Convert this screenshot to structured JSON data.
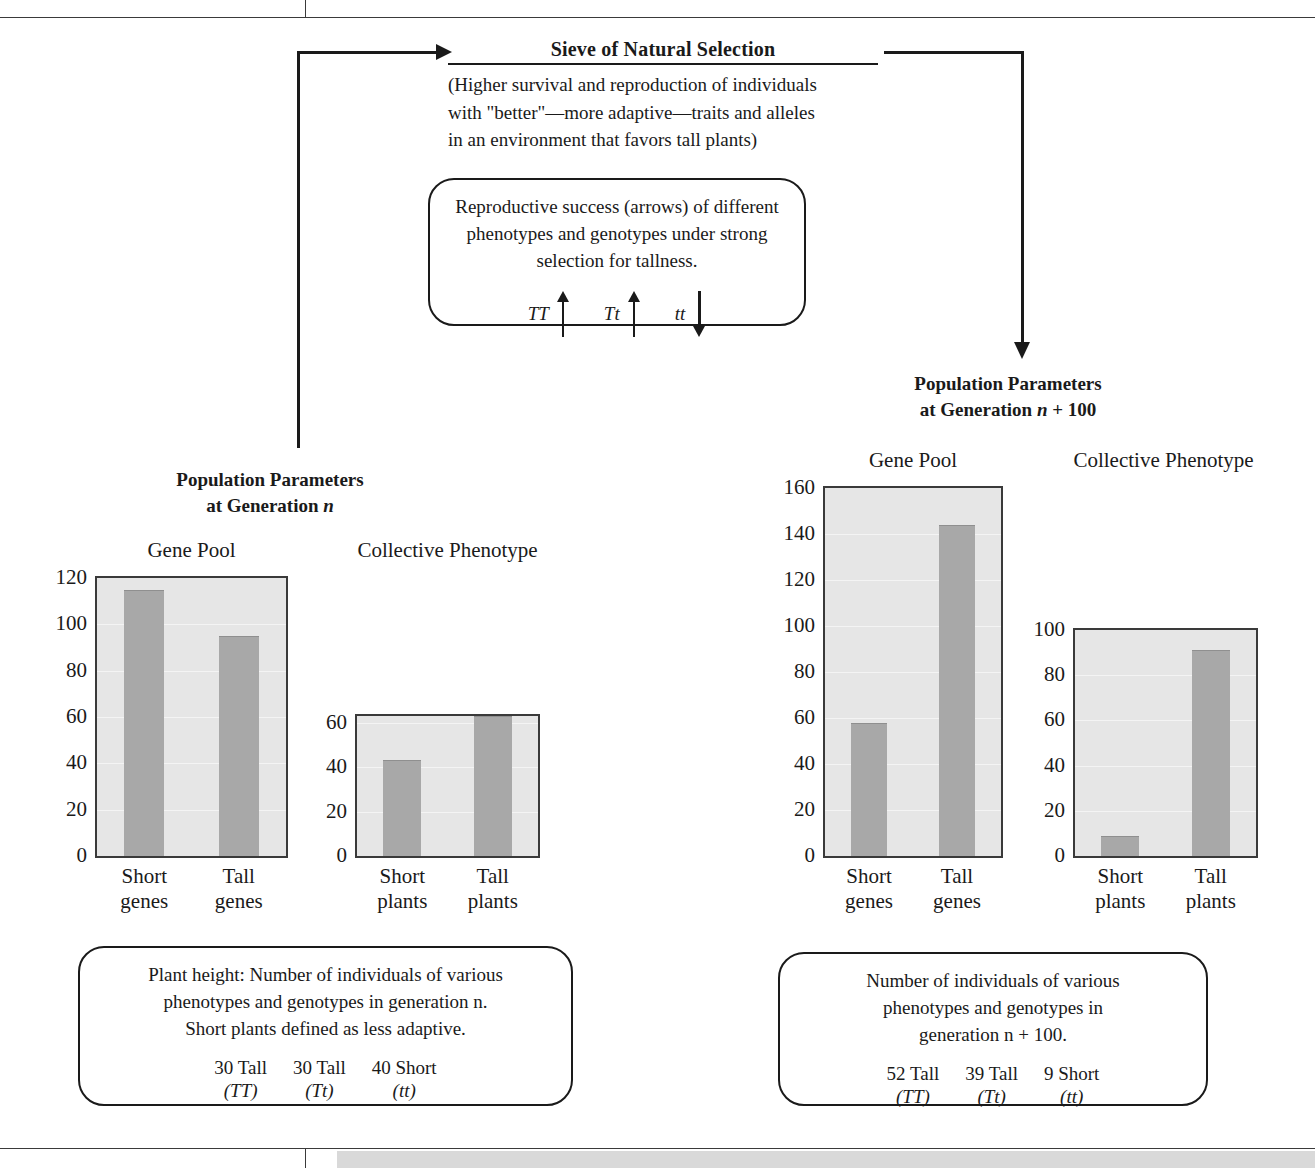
{
  "sieve": {
    "title": "Sieve of Natural Selection",
    "subtitle": "(Higher survival and reproduction of individuals\nwith \"better\"—more adaptive—traits and alleles\nin an environment that favors tall plants)"
  },
  "repro_box": {
    "text": "Reproductive success (arrows) of different\nphenotypes and genotypes under strong\nselection for tallness.",
    "genotypes": [
      {
        "label": "TT",
        "arrow": "up-arrow"
      },
      {
        "label": "Tt",
        "arrow": "up-arrow"
      },
      {
        "label": "tt",
        "arrow": "down-arrow"
      }
    ]
  },
  "left_group": {
    "title_line1": "Population Parameters",
    "title_line2_pre": "at Generation ",
    "title_line2_ital": "n",
    "note": {
      "text": "Plant height: Number of individuals of various\nphenotypes and genotypes in generation n.\nShort plants defined as less adaptive.",
      "genotype_counts": [
        {
          "count": "30 Tall",
          "code": "(TT)"
        },
        {
          "count": "30 Tall",
          "code": "(Tt)"
        },
        {
          "count": "40 Short",
          "code": "(tt)"
        }
      ]
    }
  },
  "right_group": {
    "title_line1": "Population Parameters",
    "title_line2_pre": "at Generation ",
    "title_line2_ital": "n",
    "title_line2_post": " + 100",
    "note": {
      "text": "Number of individuals of various\nphenotypes and genotypes in\ngeneration n + 100.",
      "genotype_counts": [
        {
          "count": "52 Tall",
          "code": "(TT)"
        },
        {
          "count": "39 Tall",
          "code": "(Tt)"
        },
        {
          "count": "9 Short",
          "code": "(tt)"
        }
      ]
    }
  },
  "colors": {
    "bar_fill": "#a8a8a8",
    "plot_bg": "#e6e6e6",
    "axis": "#3a3a3a",
    "ink": "#1a1a1a",
    "gray_band": "#d9d9d9"
  },
  "chart_data": [
    {
      "id": "gene-pool-gen-n",
      "type": "bar",
      "title": "Gene Pool",
      "categories": [
        "Short\ngenes",
        "Tall\ngenes"
      ],
      "values": [
        115,
        95
      ],
      "xlabel": "",
      "ylabel": "",
      "ylim": [
        0,
        120
      ],
      "yticks": [
        0,
        20,
        40,
        60,
        80,
        100,
        120
      ],
      "grid": true,
      "legend": "none"
    },
    {
      "id": "collective-phenotype-gen-n",
      "type": "bar",
      "title": "Collective Phenotype",
      "categories": [
        "Short\nplants",
        "Tall\nplants"
      ],
      "values": [
        43,
        63
      ],
      "xlabel": "",
      "ylabel": "",
      "ylim": [
        0,
        63
      ],
      "yticks": [
        0,
        20,
        40,
        60
      ],
      "grid": true,
      "legend": "none"
    },
    {
      "id": "gene-pool-gen-n-100",
      "type": "bar",
      "title": "Gene Pool",
      "categories": [
        "Short\ngenes",
        "Tall\ngenes"
      ],
      "values": [
        58,
        144
      ],
      "xlabel": "",
      "ylabel": "",
      "ylim": [
        0,
        160
      ],
      "yticks": [
        0,
        20,
        40,
        60,
        80,
        100,
        120,
        140,
        160
      ],
      "grid": true,
      "legend": "none"
    },
    {
      "id": "collective-phenotype-gen-n-100",
      "type": "bar",
      "title": "Collective Phenotype",
      "categories": [
        "Short\nplants",
        "Tall\nplants"
      ],
      "values": [
        9,
        91
      ],
      "xlabel": "",
      "ylabel": "",
      "ylim": [
        0,
        100
      ],
      "yticks": [
        0,
        20,
        40,
        60,
        80,
        100
      ],
      "grid": true,
      "legend": "none"
    }
  ]
}
